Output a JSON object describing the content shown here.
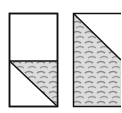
{
  "figure": {
    "colors": {
      "line": "#111111",
      "fabric_light": "#d6d6d6",
      "fabric_dark": "#8a8a8a",
      "background": "#ffffff"
    }
  }
}
